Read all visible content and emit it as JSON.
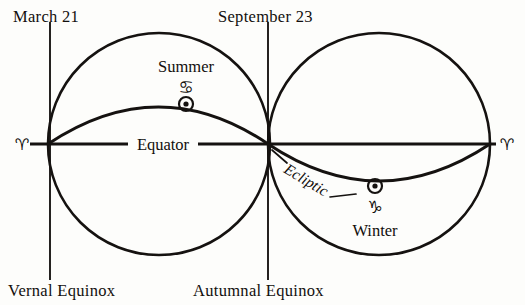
{
  "figure": {
    "background_color": "#fdfdfb",
    "ink_color": "#151210"
  },
  "labels": {
    "date_left": "March 21",
    "date_right": "September 23",
    "equinox_left": "Vernal Equinox",
    "equinox_right": "Autumnal Equinox",
    "equator": "Equator",
    "ecliptic": "Ecliptic",
    "season_summer": "Summer",
    "season_winter": "Winter"
  },
  "symbols": {
    "aries_left": "♈",
    "aries_right": "♈",
    "cancer": "♋",
    "capricorn": "♑",
    "sun_summer": "⊙",
    "sun_winter": "⊙"
  },
  "symbol_names": {
    "aries_left": "aries-glyph",
    "aries_right": "aries-glyph",
    "cancer": "cancer-glyph",
    "capricorn": "capricorn-glyph",
    "sun_summer": "sun-symbol",
    "sun_winter": "sun-symbol"
  },
  "geometry": {
    "equator_y": 144,
    "left_circle": {
      "cx": 159,
      "cy": 144,
      "r": 111
    },
    "right_circle": {
      "cx": 379,
      "cy": 144,
      "r": 111
    },
    "date_line_left_x": 50,
    "date_line_right_x": 268,
    "sun_summer": {
      "cx": 186,
      "cy": 104
    },
    "sun_winter": {
      "cx": 375,
      "cy": 186
    }
  }
}
